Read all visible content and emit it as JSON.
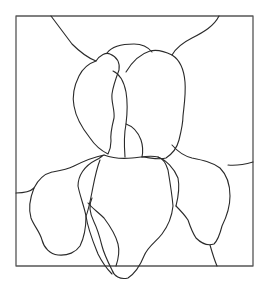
{
  "figure": {
    "title": "Iris stained glass pattern",
    "style": "line-art outline",
    "colors": {
      "background": "#ffffff",
      "frame_stroke": "#555555",
      "line_stroke": "#2a2a2a"
    },
    "frame": {
      "x": 16,
      "y": 16,
      "width": 237,
      "height": 250
    },
    "regions": [
      "background-top-left",
      "background-top-center",
      "background-top-right",
      "background-left",
      "background-right",
      "background-bottom-left",
      "background-bottom-center",
      "background-bottom-right",
      "upper-petal-left",
      "upper-petal-center-left",
      "upper-petal-center-small",
      "upper-petal-right",
      "lower-petal-left",
      "lower-petal-center",
      "lower-petal-right",
      "lower-petal-inner-left",
      "lower-petal-inner-right"
    ]
  }
}
